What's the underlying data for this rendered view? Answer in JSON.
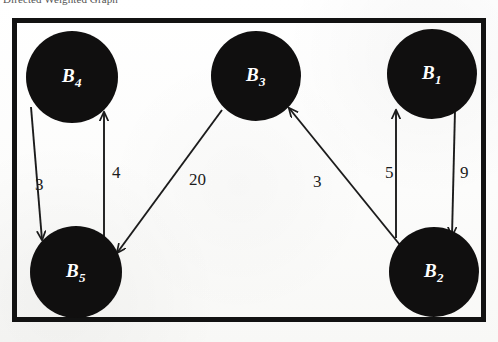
{
  "caption": {
    "text": "Directed Weighted Graph"
  },
  "figure": {
    "title": "Directed Weighted Graph",
    "frame": {
      "border_color": "#121212",
      "border_width": 5
    },
    "node_color": "#100f0f",
    "node_label_color": "#ffffff",
    "edge_color": "#1c1c1c",
    "background": "#fdfdfc"
  },
  "graph": {
    "type": "directed-weighted-graph",
    "nodes": [
      {
        "id": "B4",
        "base": "B",
        "sub": "4",
        "label": "B4",
        "cx": 72,
        "cy": 77,
        "r": 46
      },
      {
        "id": "B3",
        "base": "B",
        "sub": "3",
        "label": "B3",
        "cx": 256,
        "cy": 76,
        "r": 45
      },
      {
        "id": "B1",
        "base": "B",
        "sub": "1",
        "label": "B1",
        "cx": 432,
        "cy": 74,
        "r": 45
      },
      {
        "id": "B5",
        "base": "B",
        "sub": "5",
        "label": "B5",
        "cx": 76,
        "cy": 272,
        "r": 46
      },
      {
        "id": "B2",
        "base": "B",
        "sub": "2",
        "label": "B2",
        "cx": 434,
        "cy": 272,
        "r": 45
      }
    ],
    "edges": [
      {
        "from": "B4",
        "to": "B5",
        "weight": "3",
        "label_x": 35,
        "label_y": 175
      },
      {
        "from": "B5",
        "to": "B4",
        "weight": "4",
        "label_x": 112,
        "label_y": 163
      },
      {
        "from": "B3",
        "to": "B5",
        "weight": "20",
        "label_x": 189,
        "label_y": 170
      },
      {
        "from": "B2",
        "to": "B3",
        "weight": "3",
        "label_x": 313,
        "label_y": 172
      },
      {
        "from": "B2",
        "to": "B1",
        "weight": "5",
        "label_x": 385,
        "label_y": 163
      },
      {
        "from": "B1",
        "to": "B2",
        "weight": "9",
        "label_x": 460,
        "label_y": 163
      }
    ],
    "edge_list_text": [
      "B4 -> B5 (3)",
      "B5 -> B4 (4)",
      "B3 -> B5 (20)",
      "B2 -> B3 (3)",
      "B2 -> B1 (5)",
      "B1 -> B2 (9)"
    ]
  }
}
